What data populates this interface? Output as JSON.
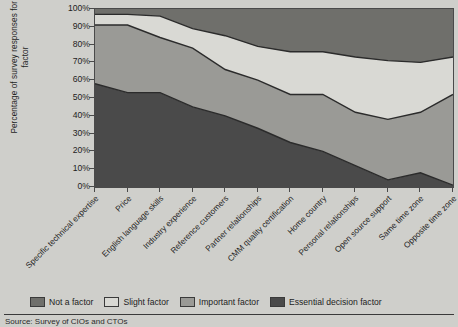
{
  "chart_data": {
    "type": "area",
    "stacked": "percent",
    "title": "",
    "xlabel": "",
    "ylabel": "Percentage of survey responses for each factor",
    "ylim": [
      0,
      100
    ],
    "grid": false,
    "legend_position": "bottom",
    "ytick_labels": [
      "0%",
      "10%",
      "20%",
      "30%",
      "40%",
      "50%",
      "60%",
      "70%",
      "80%",
      "90%",
      "100%"
    ],
    "ytick_values": [
      0,
      10,
      20,
      30,
      40,
      50,
      60,
      70,
      80,
      90,
      100
    ],
    "categories": [
      "Specific technical expertise",
      "Price",
      "English language skills",
      "Industry experience",
      "Reference customers",
      "Partner relationships",
      "CMM quality certification",
      "Home country",
      "Personal relationships",
      "Open source support",
      "Same time zone",
      "Opposite time zone"
    ],
    "series": [
      {
        "name": "Essential decision factor",
        "color": "#4a4a4a",
        "values": [
          58,
          53,
          53,
          45,
          40,
          33,
          25,
          20,
          12,
          4,
          8,
          1
        ]
      },
      {
        "name": "Important factor",
        "color": "#9a9a96",
        "values": [
          33,
          38,
          31,
          33,
          26,
          27,
          27,
          32,
          30,
          34,
          34,
          51
        ]
      },
      {
        "name": "Slight factor",
        "color": "#d9d9d4",
        "values": [
          6,
          6,
          12,
          11,
          19,
          19,
          24,
          24,
          31,
          33,
          28,
          21
        ]
      },
      {
        "name": "Not a factor",
        "color": "#6f6f6b",
        "values": [
          3,
          3,
          4,
          11,
          15,
          21,
          24,
          24,
          27,
          29,
          30,
          27
        ]
      }
    ],
    "cumulative_tops": {
      "essential": [
        58,
        53,
        53,
        45,
        40,
        33,
        25,
        20,
        12,
        4,
        8,
        1
      ],
      "important": [
        91,
        91,
        84,
        78,
        66,
        60,
        52,
        52,
        42,
        38,
        42,
        52
      ],
      "slight": [
        97,
        97,
        96,
        89,
        85,
        79,
        76,
        76,
        73,
        71,
        70,
        73
      ],
      "not_a_factor": [
        100,
        100,
        100,
        100,
        100,
        100,
        100,
        100,
        100,
        100,
        100,
        100
      ]
    }
  },
  "legend": {
    "items": [
      {
        "label": "Not a factor",
        "color": "#6f6f6b"
      },
      {
        "label": "Slight factor",
        "color": "#d9d9d4"
      },
      {
        "label": "Important factor",
        "color": "#9a9a96"
      },
      {
        "label": "Essential decision factor",
        "color": "#4a4a4a"
      }
    ]
  },
  "footer": {
    "source": "Source: Survey of CIOs and CTOs"
  }
}
